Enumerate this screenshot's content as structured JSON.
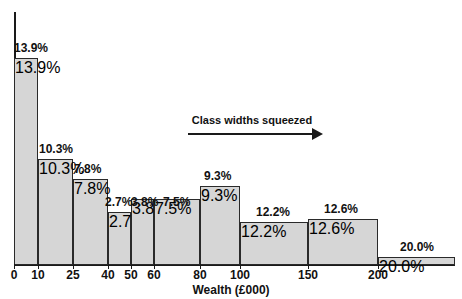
{
  "chart_data": {
    "type": "bar",
    "title": "",
    "xlabel": "Wealth (£000)",
    "ylabel": "",
    "categories": [
      "0–10",
      "10–25",
      "25–40",
      "40–50",
      "50–60",
      "60–80",
      "80–100",
      "100–150",
      "150–200",
      "200+"
    ],
    "values": [
      13.9,
      10.3,
      7.8,
      2.7,
      3.8,
      7.5,
      9.3,
      12.2,
      12.6,
      20.0
    ],
    "value_labels": [
      "13.9%",
      "10.3%",
      "7.8%",
      "2.7%",
      "3.8%",
      "7.5%",
      "9.3%",
      "12.2%",
      "12.6%",
      "20.0%"
    ],
    "bin_edges": [
      0,
      10,
      25,
      40,
      50,
      60,
      80,
      100,
      150,
      200,
      260
    ],
    "class_widths": [
      10,
      15,
      15,
      10,
      10,
      20,
      20,
      50,
      50,
      60
    ],
    "frequency_density": [
      1.39,
      0.687,
      0.52,
      0.27,
      0.38,
      0.375,
      0.465,
      0.244,
      0.252,
      0.333
    ],
    "xticks": [
      0,
      10,
      25,
      40,
      50,
      60,
      80,
      100,
      150,
      200
    ],
    "xtick_labels": [
      "0",
      "10",
      "25",
      "40",
      "50",
      "60",
      "80",
      "100",
      "150",
      "200"
    ],
    "xlim": [
      0,
      260
    ],
    "grid": false,
    "legend": null,
    "annotations": [
      {
        "text": "Class widths squeezed",
        "style": "underlined-arrow-right"
      }
    ],
    "bar_fill_color": "#d6d6d6",
    "bar_edge_color": "#2a2a2a",
    "axis_color": "#1a1a1a",
    "note_glyph": ""
  },
  "bars": [
    {
      "label": "13.9%",
      "left": 14,
      "width": 24,
      "top": 58,
      "height": 207
    },
    {
      "label": "10.3%",
      "left": 38,
      "width": 35,
      "top": 159,
      "height": 106
    },
    {
      "label": "7.8%",
      "left": 73,
      "width": 35,
      "top": 179,
      "height": 86
    },
    {
      "label": "2.7%",
      "left": 108,
      "width": 23,
      "top": 212,
      "height": 53
    },
    {
      "label": "3.8%",
      "left": 131,
      "width": 23,
      "top": 199,
      "height": 66
    },
    {
      "label": "7.5%",
      "left": 154,
      "width": 46,
      "top": 199,
      "height": 66
    },
    {
      "label": "9.3%",
      "left": 200,
      "width": 40,
      "top": 186,
      "height": 79
    },
    {
      "label": "12.2%",
      "left": 240,
      "width": 68,
      "top": 222,
      "height": 43
    },
    {
      "label": "12.6%",
      "left": 308,
      "width": 70,
      "top": 219,
      "height": 46
    },
    {
      "label": "20.0%",
      "left": 378,
      "width": 77,
      "top": 257,
      "height": 8
    }
  ],
  "bar_labels": [
    {
      "text": "13.9%",
      "left": 14,
      "top": 41
    },
    {
      "text": "10.3%",
      "left": 39,
      "top": 142
    },
    {
      "text": "7.8%",
      "left": 74,
      "top": 162
    },
    {
      "text": "2.7%",
      "left": 105,
      "top": 195
    },
    {
      "text": "3.8%",
      "left": 131,
      "top": 195
    },
    {
      "text": "7.5%",
      "left": 163,
      "top": 195
    },
    {
      "text": "9.3%",
      "left": 204,
      "top": 169
    },
    {
      "text": "12.2%",
      "left": 256,
      "top": 205
    },
    {
      "text": "12.6%",
      "left": 324,
      "top": 202
    },
    {
      "text": "20.0%",
      "left": 400,
      "top": 240
    }
  ],
  "xticks": [
    {
      "label": "0",
      "x": 14
    },
    {
      "label": "10",
      "x": 38
    },
    {
      "label": "25",
      "x": 73
    },
    {
      "label": "40",
      "x": 108
    },
    {
      "label": "50",
      "x": 131
    },
    {
      "label": "60",
      "x": 154
    },
    {
      "label": "80",
      "x": 200
    },
    {
      "label": "100",
      "x": 240
    },
    {
      "label": "150",
      "x": 308
    },
    {
      "label": "200",
      "x": 378
    }
  ],
  "axis": {
    "x_title": "Wealth (£000)"
  },
  "annotation": {
    "text": "Class widths squeezed"
  }
}
